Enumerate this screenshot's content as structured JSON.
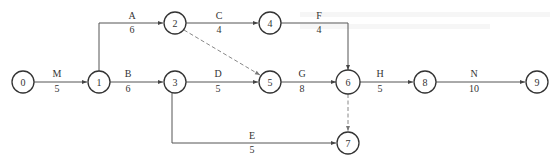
{
  "diagram": {
    "type": "activity-on-arrow network",
    "nodes": [
      {
        "id": "0",
        "label": "0",
        "x": 23,
        "y": 82
      },
      {
        "id": "1",
        "label": "1",
        "x": 99,
        "y": 82
      },
      {
        "id": "2",
        "label": "2",
        "x": 175,
        "y": 23
      },
      {
        "id": "3",
        "label": "3",
        "x": 175,
        "y": 82
      },
      {
        "id": "4",
        "label": "4",
        "x": 270,
        "y": 23
      },
      {
        "id": "5",
        "label": "5",
        "x": 270,
        "y": 82
      },
      {
        "id": "6",
        "label": "6",
        "x": 348,
        "y": 82
      },
      {
        "id": "7",
        "label": "7",
        "x": 348,
        "y": 143
      },
      {
        "id": "8",
        "label": "8",
        "x": 425,
        "y": 82
      },
      {
        "id": "9",
        "label": "9",
        "x": 537,
        "y": 82
      }
    ],
    "edges": [
      {
        "from": "0",
        "to": "1",
        "name": "M",
        "duration": "5",
        "dummy": false
      },
      {
        "from": "1",
        "to": "2",
        "name": "A",
        "duration": "6",
        "dummy": false
      },
      {
        "from": "1",
        "to": "3",
        "name": "B",
        "duration": "6",
        "dummy": false
      },
      {
        "from": "2",
        "to": "4",
        "name": "C",
        "duration": "4",
        "dummy": false
      },
      {
        "from": "2",
        "to": "5",
        "name": "",
        "duration": "",
        "dummy": true
      },
      {
        "from": "3",
        "to": "5",
        "name": "D",
        "duration": "5",
        "dummy": false
      },
      {
        "from": "3",
        "to": "7",
        "name": "E",
        "duration": "5",
        "dummy": false
      },
      {
        "from": "4",
        "to": "6",
        "name": "F",
        "duration": "4",
        "dummy": false
      },
      {
        "from": "5",
        "to": "6",
        "name": "G",
        "duration": "8",
        "dummy": false
      },
      {
        "from": "6",
        "to": "7",
        "name": "",
        "duration": "",
        "dummy": true
      },
      {
        "from": "6",
        "to": "8",
        "name": "H",
        "duration": "5",
        "dummy": false
      },
      {
        "from": "8",
        "to": "9",
        "name": "N",
        "duration": "10",
        "dummy": false
      }
    ]
  },
  "labels": {
    "node_0": "0",
    "node_1": "1",
    "node_2": "2",
    "node_3": "3",
    "node_4": "4",
    "node_5": "5",
    "node_6": "6",
    "node_7": "7",
    "node_8": "8",
    "node_9": "9",
    "edge_M_name": "M",
    "edge_M_dur": "5",
    "edge_A_name": "A",
    "edge_A_dur": "6",
    "edge_B_name": "B",
    "edge_B_dur": "6",
    "edge_C_name": "C",
    "edge_C_dur": "4",
    "edge_D_name": "D",
    "edge_D_dur": "5",
    "edge_E_name": "E",
    "edge_E_dur": "5",
    "edge_F_name": "F",
    "edge_F_dur": "4",
    "edge_G_name": "G",
    "edge_G_dur": "8",
    "edge_H_name": "H",
    "edge_H_dur": "5",
    "edge_N_name": "N",
    "edge_N_dur": "10"
  },
  "colors": {
    "stroke": "#333333",
    "edge": "#555555",
    "dummy_edge": "#888888",
    "background": "#ffffff"
  }
}
